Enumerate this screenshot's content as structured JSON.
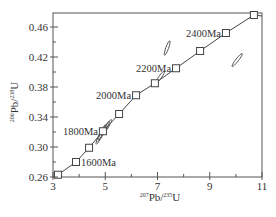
{
  "chart_data": {
    "type": "scatter",
    "subtype": "U-Pb concordia diagram",
    "title": "",
    "xlabel": "207Pb/235U",
    "ylabel": "206Pb/238U",
    "xlabel_parts": {
      "sup1": "207",
      "base1": "Pb/",
      "sup2": "235",
      "base2": "U"
    },
    "ylabel_parts": {
      "sup1": "206",
      "base1": "Pb/",
      "sup2": "238",
      "base2": "U"
    },
    "xlim": [
      3,
      11
    ],
    "ylim": [
      0.26,
      0.48
    ],
    "x_ticks": [
      3,
      5,
      7,
      9,
      11
    ],
    "x_tick_labels": [
      "3",
      "5",
      "7",
      "9",
      "11"
    ],
    "x_minor_ticks": [
      4,
      6,
      8,
      10
    ],
    "y_ticks": [
      0.26,
      0.3,
      0.34,
      0.38,
      0.42,
      0.46
    ],
    "y_tick_labels": [
      "0.26",
      "0.30",
      "0.34",
      "0.38",
      "0.42",
      "0.46"
    ],
    "y_minor_ticks": [
      0.28,
      0.32,
      0.36,
      0.4,
      0.44
    ],
    "grid": false,
    "legend": null,
    "concordia": {
      "color": "#444444",
      "age_markers": [
        {
          "age_ma": 1500,
          "x": 3.19,
          "y": 0.263,
          "label": ""
        },
        {
          "age_ma": 1600,
          "x": 3.88,
          "y": 0.28,
          "label": "1600Ma"
        },
        {
          "age_ma": 1700,
          "x": 4.38,
          "y": 0.299,
          "label": ""
        },
        {
          "age_ma": 1800,
          "x": 4.91,
          "y": 0.321,
          "label": "1800Ma"
        },
        {
          "age_ma": 1900,
          "x": 5.53,
          "y": 0.344,
          "label": ""
        },
        {
          "age_ma": 2000,
          "x": 6.18,
          "y": 0.369,
          "label": "2000Ma"
        },
        {
          "age_ma": 2100,
          "x": 6.9,
          "y": 0.385,
          "label": ""
        },
        {
          "age_ma": 2200,
          "x": 7.71,
          "y": 0.405,
          "label": "2200Ma"
        },
        {
          "age_ma": 2300,
          "x": 8.63,
          "y": 0.428,
          "label": ""
        },
        {
          "age_ma": 2400,
          "x": 9.62,
          "y": 0.452,
          "label": "2400Ma"
        },
        {
          "age_ma": 2500,
          "x": 10.69,
          "y": 0.476,
          "label": ""
        }
      ]
    },
    "error_ellipses": [
      {
        "x": 4.85,
        "y": 0.318,
        "rx": 0.45,
        "ry": 0.006,
        "angle_deg": -62,
        "note": "cluster near 1800Ma"
      },
      {
        "x": 4.95,
        "y": 0.322,
        "rx": 0.5,
        "ry": 0.005,
        "angle_deg": -60,
        "note": "cluster near 1800Ma"
      },
      {
        "x": 5.05,
        "y": 0.326,
        "rx": 0.4,
        "ry": 0.005,
        "angle_deg": -58,
        "note": "cluster near 1800Ma"
      },
      {
        "x": 4.8,
        "y": 0.314,
        "rx": 0.35,
        "ry": 0.005,
        "angle_deg": -63,
        "note": "cluster near 1800Ma"
      },
      {
        "x": 7.1,
        "y": 0.393,
        "rx": 0.28,
        "ry": 0.004,
        "angle_deg": -55,
        "note": "near 2100Ma"
      },
      {
        "x": 7.37,
        "y": 0.432,
        "rx": 0.28,
        "ry": 0.004,
        "angle_deg": -70,
        "note": "upper discordant"
      },
      {
        "x": 10.05,
        "y": 0.416,
        "rx": 0.32,
        "ry": 0.005,
        "angle_deg": -52,
        "note": "right discordant"
      }
    ]
  }
}
